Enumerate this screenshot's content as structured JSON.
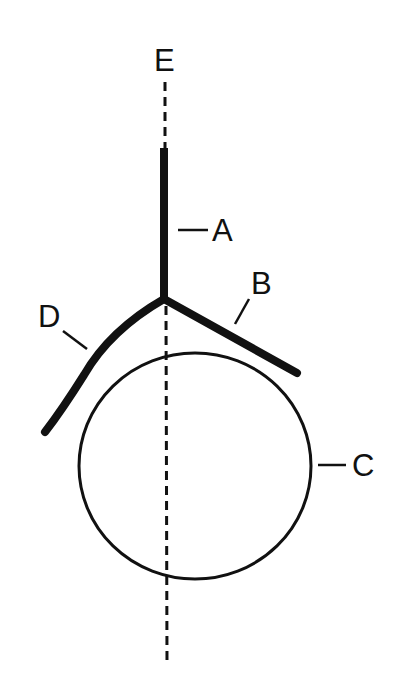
{
  "diagram": {
    "labels": {
      "A": "A",
      "B": "B",
      "C": "C",
      "D": "D",
      "E": "E"
    },
    "elements": [
      {
        "id": "A",
        "description": "thick vertical line segment above the junction"
      },
      {
        "id": "B",
        "description": "thick straight line going down-right from the junction"
      },
      {
        "id": "C",
        "description": "circle below the junction"
      },
      {
        "id": "D",
        "description": "thick curved line going down-left from the junction"
      },
      {
        "id": "E",
        "description": "dashed vertical axis line"
      }
    ],
    "colors": {
      "stroke": "#111111",
      "background": "#ffffff"
    }
  }
}
